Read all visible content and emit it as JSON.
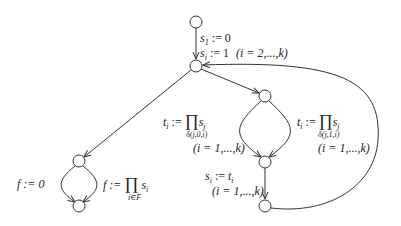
{
  "diagram": {
    "type": "control-flow-graph",
    "nodes": [
      {
        "id": "start",
        "x": 196,
        "y": 22
      },
      {
        "id": "hub",
        "x": 196,
        "y": 66
      },
      {
        "id": "right-top",
        "x": 265,
        "y": 96
      },
      {
        "id": "right-mid",
        "x": 265,
        "y": 162
      },
      {
        "id": "right-bottom",
        "x": 265,
        "y": 206
      },
      {
        "id": "left-top",
        "x": 79,
        "y": 161
      },
      {
        "id": "left-bottom",
        "x": 79,
        "y": 206
      }
    ],
    "labels": {
      "init1": {
        "var": "s",
        "sub": "1",
        "rest": ":= 0"
      },
      "init2": {
        "var": "s",
        "sub": "i",
        "rest": ":= 1",
        "range": "(i = 2,...,k)"
      },
      "t_left": {
        "lhs": "t",
        "lhs_sub": "i",
        "op": ":=",
        "prod": "∏",
        "rhs": "s",
        "rhs_sub": "j",
        "under": "δ(j,0,i)",
        "range": "(i = 1,...,k)"
      },
      "t_right": {
        "lhs": "t",
        "lhs_sub": "i",
        "op": ":=",
        "prod": "∏",
        "rhs": "s",
        "rhs_sub": "j",
        "under": "δ(j,1,i)",
        "range": "(i = 1,...,k)"
      },
      "s_update": {
        "lhs": "s",
        "lhs_sub": "i",
        "op": ":=",
        "rhs": "t",
        "rhs_sub": "i",
        "range": "(i = 1,...,k)"
      },
      "f_zero": {
        "text": "f := 0"
      },
      "f_prod": {
        "lhs": "f :=",
        "prod": "∏",
        "rhs": "s",
        "rhs_sub": "i",
        "under": "i∈F"
      }
    },
    "colors": {
      "stroke": "#333333",
      "node_fill": "#ffffff"
    }
  }
}
